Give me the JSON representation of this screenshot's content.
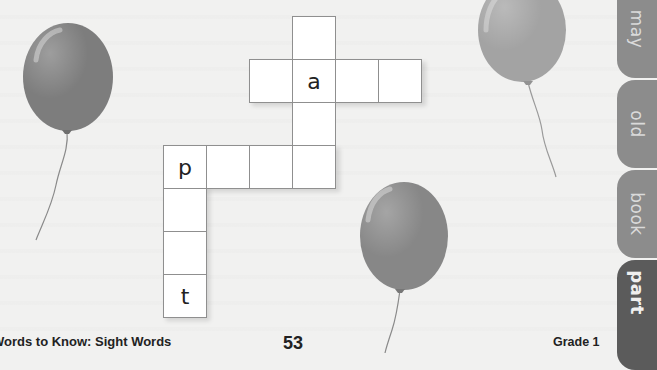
{
  "puzzle": {
    "title": "Sight word crossword grid",
    "cells": [
      {
        "id": "c1",
        "x": 292,
        "y": 16,
        "letter": ""
      },
      {
        "id": "c2",
        "x": 249,
        "y": 59,
        "letter": ""
      },
      {
        "id": "c3",
        "x": 292,
        "y": 59,
        "letter": "a"
      },
      {
        "id": "c4",
        "x": 335,
        "y": 59,
        "letter": ""
      },
      {
        "id": "c5",
        "x": 378,
        "y": 59,
        "letter": ""
      },
      {
        "id": "c6",
        "x": 292,
        "y": 102,
        "letter": ""
      },
      {
        "id": "c7",
        "x": 163,
        "y": 145,
        "letter": "p"
      },
      {
        "id": "c8",
        "x": 206,
        "y": 145,
        "letter": ""
      },
      {
        "id": "c9",
        "x": 249,
        "y": 145,
        "letter": ""
      },
      {
        "id": "c10",
        "x": 292,
        "y": 145,
        "letter": ""
      },
      {
        "id": "c11",
        "x": 163,
        "y": 188,
        "letter": ""
      },
      {
        "id": "c12",
        "x": 163,
        "y": 231,
        "letter": ""
      },
      {
        "id": "c13",
        "x": 163,
        "y": 274,
        "letter": "t"
      }
    ]
  },
  "balloons": [
    {
      "name": "left-balloon",
      "cx": 68,
      "cy": 77,
      "rx": 45,
      "ry": 54,
      "color": "#7d7d7d",
      "knot": [
        67,
        131
      ],
      "string_end": [
        36,
        240
      ]
    },
    {
      "name": "top-right-balloon",
      "cx": 522,
      "cy": 30,
      "rx": 44,
      "ry": 52,
      "color": "#a3a3a3",
      "knot": [
        528,
        82
      ],
      "string_end": [
        556,
        177
      ]
    },
    {
      "name": "bottom-balloon",
      "cx": 404,
      "cy": 236,
      "rx": 44,
      "ry": 54,
      "color": "#878787",
      "knot": [
        400,
        290
      ],
      "string_end": [
        385,
        353
      ]
    }
  ],
  "tabs": [
    {
      "label": "may",
      "top": -20,
      "height": 98,
      "bg": "#8c8c8c",
      "fg": "#d9d9d9"
    },
    {
      "label": "old",
      "top": 80,
      "height": 88,
      "bg": "#8c8c8c",
      "fg": "#d9d9d9"
    },
    {
      "label": "book",
      "top": 170,
      "height": 88,
      "bg": "#8c8c8c",
      "fg": "#d9d9d9"
    },
    {
      "label": "part",
      "top": 260,
      "height": 110,
      "bg": "#5b5b5b",
      "fg": "#ececec"
    }
  ],
  "footer": {
    "book_title": "Words to Know: Sight Words",
    "page_number": "53",
    "grade": "Grade 1"
  }
}
